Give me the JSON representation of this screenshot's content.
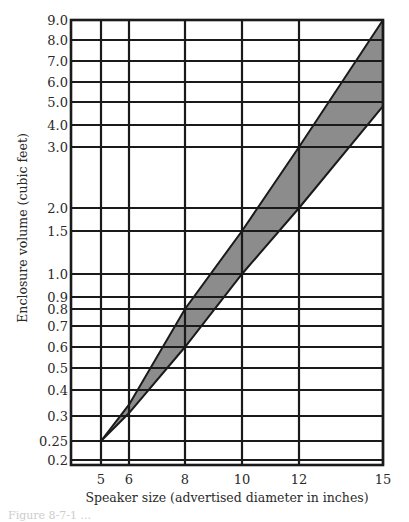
{
  "chart_data": {
    "type": "area",
    "title": "",
    "xlabel": "Speaker size (advertised diameter in inches)",
    "ylabel": "Enclosure volume (cubic feet)",
    "x_ticks": [
      {
        "label": "5",
        "value": 5,
        "px": 101
      },
      {
        "label": "6",
        "value": 6,
        "px": 129
      },
      {
        "label": "8",
        "value": 8,
        "px": 185
      },
      {
        "label": "10",
        "value": 10,
        "px": 242
      },
      {
        "label": "12",
        "value": 12,
        "px": 299
      },
      {
        "label": "15",
        "value": 15,
        "px": 383
      }
    ],
    "y_ticks": [
      {
        "label": "9.0",
        "value": 9.0,
        "px": 20
      },
      {
        "label": "8.0",
        "value": 8.0,
        "px": 40
      },
      {
        "label": "7.0",
        "value": 7.0,
        "px": 61
      },
      {
        "label": "6.0",
        "value": 6.0,
        "px": 82
      },
      {
        "label": "5.0",
        "value": 5.0,
        "px": 102
      },
      {
        "label": "4.0",
        "value": 4.0,
        "px": 125
      },
      {
        "label": "3.0",
        "value": 3.0,
        "px": 147
      },
      {
        "label": "2.0",
        "value": 2.0,
        "px": 208
      },
      {
        "label": "1.5",
        "value": 1.5,
        "px": 231
      },
      {
        "label": "1.0",
        "value": 1.0,
        "px": 274
      },
      {
        "label": "0.9",
        "value": 0.9,
        "px": 297
      },
      {
        "label": "0.8",
        "value": 0.8,
        "px": 309
      },
      {
        "label": "0.7",
        "value": 0.7,
        "px": 326
      },
      {
        "label": "0.6",
        "value": 0.6,
        "px": 347
      },
      {
        "label": "0.5",
        "value": 0.5,
        "px": 368
      },
      {
        "label": "0.4",
        "value": 0.4,
        "px": 390
      },
      {
        "label": "0.3",
        "value": 0.3,
        "px": 416
      },
      {
        "label": "0.25",
        "value": 0.25,
        "px": 441
      },
      {
        "label": "0.2",
        "value": 0.2,
        "px": 460
      }
    ],
    "xlim": [
      4,
      15
    ],
    "ylim": [
      0.2,
      9.0
    ],
    "y_scale": "log (nonuniform)",
    "grid": true,
    "legend": null,
    "series": [
      {
        "name": "Upper bound (max recommended volume)",
        "x": [
          5,
          6,
          8,
          10,
          12,
          15
        ],
        "values": [
          0.25,
          0.34,
          0.8,
          1.5,
          3.0,
          9.0
        ]
      },
      {
        "name": "Lower bound (min recommended volume)",
        "x": [
          5,
          6,
          8,
          10,
          12,
          15
        ],
        "values": [
          0.25,
          0.31,
          0.6,
          1.0,
          2.0,
          4.8
        ]
      }
    ],
    "fill_between_series": true,
    "fill_color": "#8c8c8c",
    "line_color": "#1a1a1a",
    "plot_box": {
      "left": 71,
      "right": 383,
      "top": 20,
      "bottom": 465
    }
  },
  "caption": "Figure 8-7-1 ..."
}
